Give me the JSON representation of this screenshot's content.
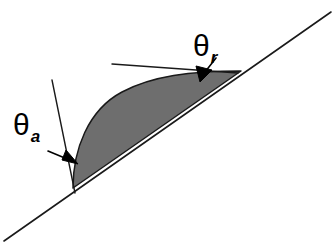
{
  "figure": {
    "name": "contact-angle-hysteresis-diagram",
    "background_color": "#ffffff",
    "width": 336,
    "height": 248,
    "stroke_color": "#1a1a1a",
    "droplet_fill_color": "#6e6e6e",
    "droplet_edge_color": "#1a1a1a"
  },
  "labels": {
    "advancing_angle": {
      "symbol": "θ",
      "subscript": "a",
      "full": "θa"
    },
    "receding_angle": {
      "symbol": "θ",
      "subscript": "r",
      "full": "θr"
    }
  },
  "elements": {
    "inclined_surface_line": "inclined-solid-surface-line",
    "droplet": "sessile-droplet-shape",
    "advancing_tangent": "advancing-tangent-line",
    "receding_tangent": "receding-tangent-line",
    "advancing_arrow": "advancing-angle-arrow",
    "receding_arrow": "receding-angle-arrow"
  }
}
